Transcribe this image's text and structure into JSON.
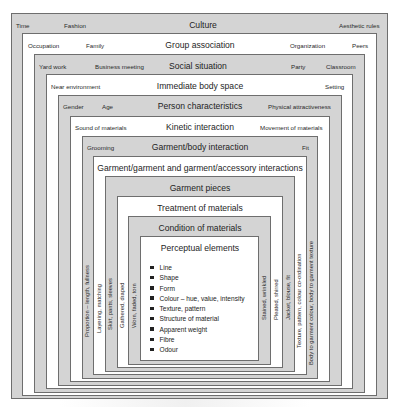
{
  "diagram": {
    "layers": [
      {
        "title": "Culture",
        "left_labels": [
          "Time",
          "Fashion"
        ],
        "right_labels": [
          "Aesthetic rules"
        ]
      },
      {
        "title": "Group association",
        "left_labels": [
          "Occupation",
          "Family"
        ],
        "right_labels": [
          "Organization",
          "Peers"
        ]
      },
      {
        "title": "Social situation",
        "left_labels": [
          "Yard work",
          "Business meeting"
        ],
        "right_labels": [
          "Party",
          "Classroom"
        ]
      },
      {
        "title": "Immediate body space",
        "left_labels": [
          "Near environment"
        ],
        "right_labels": [
          "Setting"
        ]
      },
      {
        "title": "Person characteristics",
        "left_labels": [
          "Gender",
          "Age"
        ],
        "right_labels": [
          "Physical attractiveness"
        ]
      },
      {
        "title": "Kinetic interaction",
        "left_labels": [
          "Sound of materials"
        ],
        "right_labels": [
          "Movement of materials"
        ]
      },
      {
        "title": "Garment/body interaction",
        "left_labels": [
          "Grooming"
        ],
        "right_labels": [
          "Fit"
        ]
      },
      {
        "title": "Garment/garment and garment/accessory interactions",
        "left_labels": [],
        "right_labels": []
      },
      {
        "title": "Garment pieces",
        "left_labels": [],
        "right_labels": []
      },
      {
        "title": "Treatment of materials",
        "left_labels": [],
        "right_labels": []
      },
      {
        "title": "Condition of materials",
        "left_labels": [],
        "right_labels": []
      },
      {
        "title": "Perceptual elements",
        "left_labels": [],
        "right_labels": []
      }
    ],
    "vertical_left": [
      "Proportion – length, fullness",
      "Layering, matching",
      "Skirt, pants, sleeves",
      "Gathered, draped",
      "Worn, faded, torn"
    ],
    "vertical_right": [
      "Stained, wrinkled",
      "Pleated, shirred",
      "Jacket, blouse, fit",
      "Texture, pattern, colour co-ordination",
      "Body to garment colour, body to garment texture"
    ],
    "perceptual_elements": [
      "Line",
      "Shape",
      "Form",
      "Colour – hue, value, intensity",
      "Texture, pattern",
      "Structure of material",
      "Apparent weight",
      "Fibre",
      "Odour"
    ],
    "colors": {
      "gray_fill": "#d4d4d4",
      "white_fill": "#ffffff",
      "border": "#6e6e6e"
    }
  }
}
